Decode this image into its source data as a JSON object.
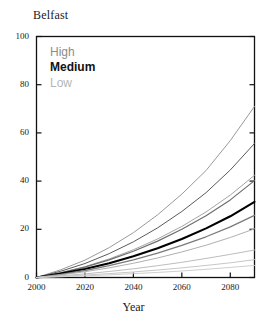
{
  "chart_data": {
    "type": "line",
    "title": "Belfast",
    "xlabel": "Year",
    "ylabel": "",
    "xlim": [
      2000,
      2090
    ],
    "ylim": [
      0,
      100
    ],
    "xticks": [
      2000,
      2020,
      2040,
      2060,
      2080
    ],
    "yticks": [
      0,
      20,
      40,
      60,
      80,
      100
    ],
    "grid": false,
    "legend_position": "top-left-inside",
    "legend": [
      {
        "label": "High",
        "color": "#8c8c8c"
      },
      {
        "label": "Medium",
        "color": "#111111"
      },
      {
        "label": "Low",
        "color": "#b5b5b5"
      }
    ],
    "x": [
      2000,
      2010,
      2020,
      2030,
      2040,
      2050,
      2060,
      2070,
      2080,
      2090
    ],
    "series": [
      {
        "name": "High upper",
        "group": "High",
        "color": "#9a9a9a",
        "width": 1.0,
        "values": [
          0,
          3.2,
          7.2,
          12.4,
          18.6,
          26.0,
          34.6,
          44.4,
          56.8,
          71.0
        ]
      },
      {
        "name": "High central",
        "group": "High",
        "color": "#5a5a5a",
        "width": 1.0,
        "values": [
          0,
          2.6,
          5.8,
          9.9,
          14.8,
          20.6,
          27.4,
          35.2,
          44.6,
          55.6
        ]
      },
      {
        "name": "High lower",
        "group": "High",
        "color": "#a5a5a5",
        "width": 1.0,
        "values": [
          0,
          2.0,
          4.5,
          7.7,
          11.5,
          16.0,
          21.2,
          27.2,
          34.2,
          42.4
        ]
      },
      {
        "name": "Medium upper",
        "group": "Medium",
        "color": "#6e6e6e",
        "width": 1.2,
        "values": [
          0,
          1.9,
          4.3,
          7.3,
          10.9,
          15.1,
          20.0,
          25.6,
          32.2,
          40.2
        ]
      },
      {
        "name": "Medium central",
        "group": "Medium",
        "color": "#000000",
        "width": 2.1,
        "values": [
          0,
          1.6,
          3.5,
          5.9,
          8.8,
          12.1,
          16.0,
          20.4,
          25.4,
          31.4
        ]
      },
      {
        "name": "Medium lower",
        "group": "Medium",
        "color": "#7a7a7a",
        "width": 1.3,
        "values": [
          0,
          1.3,
          2.9,
          4.9,
          7.3,
          10.1,
          13.3,
          16.9,
          21.0,
          25.8
        ]
      },
      {
        "name": "Low upper",
        "group": "Low",
        "color": "#b0b0b0",
        "width": 1.0,
        "values": [
          0,
          1.1,
          2.4,
          4.0,
          5.9,
          8.1,
          10.6,
          13.4,
          16.6,
          20.2
        ]
      },
      {
        "name": "Low central",
        "group": "Low",
        "color": "#bdbdbd",
        "width": 1.0,
        "values": [
          0,
          0.7,
          1.5,
          2.5,
          3.6,
          4.9,
          6.3,
          7.9,
          9.6,
          11.4
        ]
      },
      {
        "name": "Low lower",
        "group": "Low",
        "color": "#c7c7c7",
        "width": 1.0,
        "values": [
          0,
          0.5,
          1.0,
          1.6,
          2.3,
          3.1,
          4.0,
          5.0,
          6.1,
          7.4
        ]
      },
      {
        "name": "Low minimum",
        "group": "Low",
        "color": "#cfcfcf",
        "width": 1.0,
        "values": [
          0,
          0.3,
          0.7,
          1.1,
          1.6,
          2.1,
          2.7,
          3.4,
          4.2,
          5.0
        ]
      }
    ]
  },
  "axis": {
    "ytick_labels": [
      "0",
      "20",
      "40",
      "60",
      "80",
      "100"
    ],
    "xtick_labels": [
      "2000",
      "2020",
      "2040",
      "2060",
      "2080"
    ],
    "xaxis_title": "Year"
  }
}
